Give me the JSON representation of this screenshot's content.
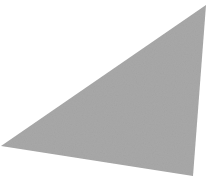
{
  "canvas": {
    "width": 220,
    "height": 179,
    "background": "#ffffff"
  },
  "shape": {
    "type": "triangle",
    "fill": "#a8a8a8",
    "points": [
      [
        206,
        5
      ],
      [
        1,
        146
      ],
      [
        193,
        176
      ]
    ]
  }
}
